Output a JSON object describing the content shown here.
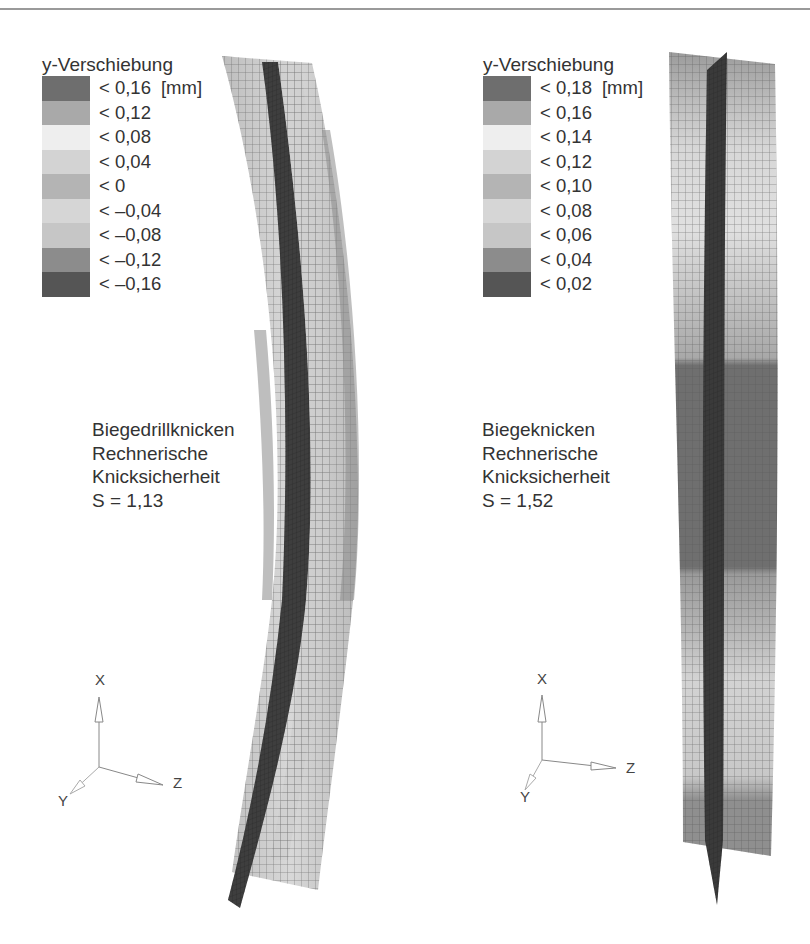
{
  "figure": {
    "left_panel": {
      "legend": {
        "title": "y-Verschiebung",
        "unit": "[mm]",
        "entries": [
          {
            "label": "< 0,16",
            "color": "#6e6e6e"
          },
          {
            "label": "< 0,12",
            "color": "#a9a9a9"
          },
          {
            "label": "< 0,08",
            "color": "#eeeeee"
          },
          {
            "label": "< 0,04",
            "color": "#d3d3d3"
          },
          {
            "label": "< 0",
            "color": "#b4b4b4"
          },
          {
            "label": "< –0,04",
            "color": "#d6d6d6"
          },
          {
            "label": "< –0,08",
            "color": "#c6c6c6"
          },
          {
            "label": "< –0,12",
            "color": "#8c8c8c"
          },
          {
            "label": "< –0,16",
            "color": "#555555"
          }
        ]
      },
      "caption": {
        "line1": "Biegedrillknicken",
        "line2": "Rechnerische",
        "line3": "Knicksicherheit",
        "line4": "S = 1,13"
      },
      "axes": {
        "x": "X",
        "y": "Y",
        "z": "Z"
      }
    },
    "right_panel": {
      "legend": {
        "title": "y-Verschiebung",
        "unit": "[mm]",
        "entries": [
          {
            "label": "< 0,18",
            "color": "#6e6e6e"
          },
          {
            "label": "< 0,16",
            "color": "#a9a9a9"
          },
          {
            "label": "< 0,14",
            "color": "#eeeeee"
          },
          {
            "label": "< 0,12",
            "color": "#d3d3d3"
          },
          {
            "label": "< 0,10",
            "color": "#b4b4b4"
          },
          {
            "label": "< 0,08",
            "color": "#d6d6d6"
          },
          {
            "label": "< 0,06",
            "color": "#c6c6c6"
          },
          {
            "label": "< 0,04",
            "color": "#8c8c8c"
          },
          {
            "label": "< 0,02",
            "color": "#555555"
          }
        ]
      },
      "caption": {
        "line1": "Biegeknicken",
        "line2": "Rechnerische",
        "line3": "Knicksicherheit",
        "line4": "S = 1,52"
      },
      "axes": {
        "x": "X",
        "y": "Y",
        "z": "Z"
      }
    }
  }
}
